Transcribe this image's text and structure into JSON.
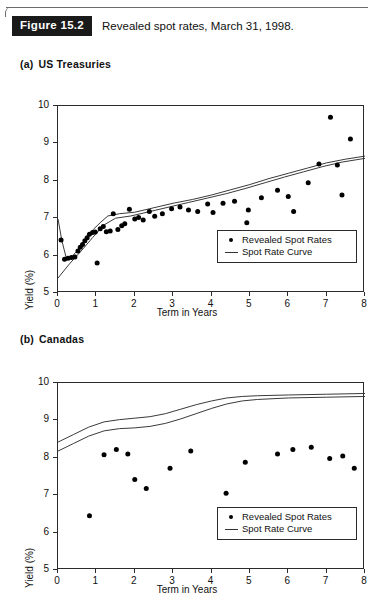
{
  "figure": {
    "badge": "Figure 15.2",
    "caption": "Revealed spot rates, March 31, 1998."
  },
  "panels": [
    {
      "tag": "(a)",
      "title": "US Treasuries"
    },
    {
      "tag": "(b)",
      "title": "Canadas"
    }
  ],
  "legend": {
    "points_label": "Revealed Spot Rates",
    "curve_label": "Spot Rate Curve"
  },
  "colors": {
    "axis": "#2b2b2b",
    "marker": "#000000",
    "curve": "#3a3a3a",
    "badge_bg": "#1a1a1a",
    "badge_text": "#ffffff"
  },
  "chart_data": [
    {
      "type": "scatter",
      "title": "US Treasuries",
      "xlabel": "Term in Years",
      "ylabel": "Yield (%)",
      "xlim": [
        0,
        8
      ],
      "ylim": [
        5,
        10
      ],
      "xticks": [
        0,
        1,
        2,
        3,
        4,
        5,
        6,
        7,
        8
      ],
      "yticks": [
        5,
        6,
        7,
        8,
        9,
        10
      ],
      "grid": false,
      "legend_position": "lower-right",
      "series": [
        {
          "name": "Revealed Spot Rates",
          "type": "scatter",
          "points": [
            [
              0.08,
              6.42
            ],
            [
              0.17,
              5.9
            ],
            [
              0.26,
              5.93
            ],
            [
              0.35,
              5.95
            ],
            [
              0.44,
              5.96
            ],
            [
              0.52,
              6.12
            ],
            [
              0.58,
              6.22
            ],
            [
              0.64,
              6.3
            ],
            [
              0.7,
              6.4
            ],
            [
              0.76,
              6.48
            ],
            [
              0.82,
              6.57
            ],
            [
              0.9,
              6.62
            ],
            [
              0.97,
              6.63
            ],
            [
              1.02,
              5.8
            ],
            [
              1.1,
              6.72
            ],
            [
              1.18,
              6.78
            ],
            [
              1.26,
              6.64
            ],
            [
              1.36,
              6.66
            ],
            [
              1.44,
              7.12
            ],
            [
              1.56,
              6.7
            ],
            [
              1.66,
              6.8
            ],
            [
              1.74,
              6.85
            ],
            [
              1.86,
              7.24
            ],
            [
              2.0,
              6.98
            ],
            [
              2.1,
              7.02
            ],
            [
              2.22,
              6.95
            ],
            [
              2.38,
              7.18
            ],
            [
              2.52,
              7.05
            ],
            [
              2.72,
              7.12
            ],
            [
              2.96,
              7.25
            ],
            [
              3.18,
              7.3
            ],
            [
              3.4,
              7.22
            ],
            [
              3.64,
              7.18
            ],
            [
              3.9,
              7.38
            ],
            [
              4.04,
              7.15
            ],
            [
              4.3,
              7.4
            ],
            [
              4.6,
              7.45
            ],
            [
              4.86,
              6.3
            ],
            [
              4.88,
              6.22
            ],
            [
              4.92,
              6.88
            ],
            [
              4.96,
              7.22
            ],
            [
              5.3,
              7.55
            ],
            [
              5.72,
              7.75
            ],
            [
              6.0,
              7.58
            ],
            [
              6.14,
              7.18
            ],
            [
              6.52,
              7.95
            ],
            [
              6.8,
              8.45
            ],
            [
              7.1,
              9.7
            ],
            [
              7.28,
              8.42
            ],
            [
              7.4,
              7.62
            ],
            [
              7.62,
              9.12
            ]
          ]
        },
        {
          "name": "Spot Rate Curve (upper)",
          "type": "line",
          "points": [
            [
              0.0,
              6.98
            ],
            [
              0.1,
              6.4
            ],
            [
              0.22,
              5.92
            ],
            [
              0.34,
              5.95
            ],
            [
              0.52,
              6.15
            ],
            [
              0.72,
              6.45
            ],
            [
              0.92,
              6.7
            ],
            [
              1.12,
              6.9
            ],
            [
              1.3,
              7.06
            ],
            [
              1.6,
              7.12
            ],
            [
              2.0,
              7.16
            ],
            [
              2.5,
              7.28
            ],
            [
              3.0,
              7.4
            ],
            [
              3.5,
              7.5
            ],
            [
              4.0,
              7.62
            ],
            [
              4.5,
              7.76
            ],
            [
              5.0,
              7.9
            ],
            [
              5.5,
              8.06
            ],
            [
              6.0,
              8.2
            ],
            [
              6.5,
              8.34
            ],
            [
              7.0,
              8.48
            ],
            [
              7.5,
              8.58
            ],
            [
              8.0,
              8.66
            ]
          ]
        },
        {
          "name": "Spot Rate Curve (lower)",
          "type": "line",
          "points": [
            [
              0.0,
              5.4
            ],
            [
              0.3,
              5.78
            ],
            [
              0.6,
              6.12
            ],
            [
              0.9,
              6.48
            ],
            [
              1.2,
              6.82
            ],
            [
              1.5,
              7.0
            ],
            [
              1.9,
              7.06
            ],
            [
              2.4,
              7.18
            ],
            [
              2.9,
              7.3
            ],
            [
              3.4,
              7.42
            ],
            [
              3.9,
              7.54
            ],
            [
              4.4,
              7.66
            ],
            [
              4.9,
              7.8
            ],
            [
              5.4,
              7.95
            ],
            [
              5.9,
              8.1
            ],
            [
              6.4,
              8.24
            ],
            [
              6.9,
              8.38
            ],
            [
              7.4,
              8.5
            ],
            [
              8.0,
              8.6
            ]
          ]
        }
      ]
    },
    {
      "type": "scatter",
      "title": "Canadas",
      "xlabel": "Term in Years",
      "ylabel": "Yield (%)",
      "xlim": [
        0,
        8
      ],
      "ylim": [
        5,
        10
      ],
      "xticks": [
        0,
        1,
        2,
        3,
        4,
        5,
        6,
        7,
        8
      ],
      "yticks": [
        5,
        6,
        7,
        8,
        9,
        10
      ],
      "grid": false,
      "legend_position": "lower-right",
      "series": [
        {
          "name": "Revealed Spot Rates",
          "type": "scatter",
          "points": [
            [
              0.82,
              6.45
            ],
            [
              1.2,
              8.08
            ],
            [
              1.52,
              8.22
            ],
            [
              1.82,
              8.1
            ],
            [
              2.0,
              7.42
            ],
            [
              2.3,
              7.18
            ],
            [
              2.92,
              7.72
            ],
            [
              3.46,
              8.18
            ],
            [
              4.38,
              7.05
            ],
            [
              4.88,
              7.88
            ],
            [
              5.72,
              8.1
            ],
            [
              6.12,
              8.22
            ],
            [
              6.6,
              8.28
            ],
            [
              7.08,
              7.98
            ],
            [
              7.42,
              8.05
            ],
            [
              7.72,
              7.72
            ]
          ]
        },
        {
          "name": "Spot Rate Curve (upper)",
          "type": "line",
          "points": [
            [
              0.0,
              8.42
            ],
            [
              0.4,
              8.62
            ],
            [
              0.8,
              8.82
            ],
            [
              1.2,
              8.96
            ],
            [
              1.6,
              9.02
            ],
            [
              2.0,
              9.06
            ],
            [
              2.4,
              9.1
            ],
            [
              2.8,
              9.18
            ],
            [
              3.2,
              9.3
            ],
            [
              3.6,
              9.42
            ],
            [
              4.0,
              9.52
            ],
            [
              4.4,
              9.6
            ],
            [
              4.8,
              9.64
            ],
            [
              5.2,
              9.66
            ],
            [
              6.0,
              9.68
            ],
            [
              7.0,
              9.7
            ],
            [
              8.0,
              9.72
            ]
          ]
        },
        {
          "name": "Spot Rate Curve (lower)",
          "type": "line",
          "points": [
            [
              0.0,
              8.18
            ],
            [
              0.4,
              8.38
            ],
            [
              0.8,
              8.58
            ],
            [
              1.2,
              8.72
            ],
            [
              1.6,
              8.78
            ],
            [
              2.0,
              8.8
            ],
            [
              2.4,
              8.84
            ],
            [
              2.8,
              8.92
            ],
            [
              3.2,
              9.04
            ],
            [
              3.6,
              9.18
            ],
            [
              4.0,
              9.32
            ],
            [
              4.4,
              9.44
            ],
            [
              4.8,
              9.52
            ],
            [
              5.2,
              9.56
            ],
            [
              6.0,
              9.6
            ],
            [
              7.0,
              9.62
            ],
            [
              8.0,
              9.64
            ]
          ]
        }
      ]
    }
  ]
}
